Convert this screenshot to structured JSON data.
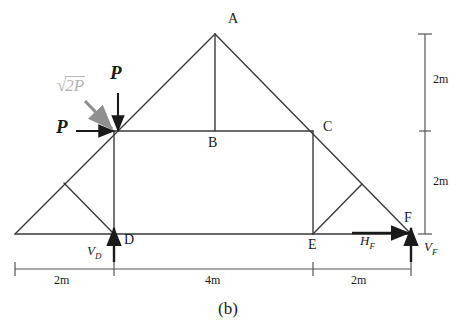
{
  "figure": {
    "caption": "(b)",
    "type": "truss-free-body-diagram"
  },
  "joints": [
    {
      "id": "A",
      "label": "A",
      "x": 215,
      "y": 34
    },
    {
      "id": "B",
      "label": "B",
      "x": 215,
      "y": 131
    },
    {
      "id": "C",
      "label": "C",
      "x": 313,
      "y": 131
    },
    {
      "id": "D",
      "label": "D",
      "x": 114,
      "y": 234
    },
    {
      "id": "E",
      "label": "E",
      "x": 313,
      "y": 234
    },
    {
      "id": "F",
      "label": "F",
      "x": 411,
      "y": 234
    },
    {
      "id": "G",
      "label": "",
      "x": 114,
      "y": 131
    },
    {
      "id": "L",
      "label": "",
      "x": 15,
      "y": 234
    }
  ],
  "loads": [
    {
      "name": "diagonal-load",
      "label_sqrt": "√",
      "label_text": "2P",
      "color": "#b3b3b3",
      "direction": "diagonal-down-right"
    },
    {
      "name": "vertical-load",
      "label": "P",
      "color": "#1a1a1a",
      "direction": "down"
    },
    {
      "name": "horizontal-load",
      "label": "P",
      "color": "#1a1a1a",
      "direction": "right"
    }
  ],
  "reactions": [
    {
      "name": "vertical-reaction-d",
      "base": "V",
      "sub": "D",
      "direction": "up"
    },
    {
      "name": "horizontal-reaction-f",
      "base": "H",
      "sub": "F",
      "direction": "right"
    },
    {
      "name": "vertical-reaction-f",
      "base": "V",
      "sub": "F",
      "direction": "up"
    }
  ],
  "dimensions": {
    "horizontal": [
      {
        "label": "2m",
        "span": "L-D"
      },
      {
        "label": "4m",
        "span": "D-E"
      },
      {
        "label": "2m",
        "span": "E-F"
      }
    ],
    "vertical": [
      {
        "label": "2m",
        "span": "A-C"
      },
      {
        "label": "2m",
        "span": "C-F"
      }
    ]
  },
  "colors": {
    "member": "#3a3a3a",
    "dimension": "#555555",
    "load_gray": "#999999",
    "load_black": "#1a1a1a",
    "background": "#ffffff"
  }
}
